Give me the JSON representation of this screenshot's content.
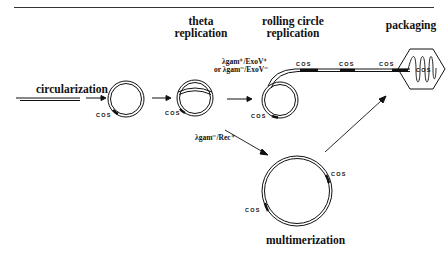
{
  "header": {
    "left": "",
    "center": "",
    "right": ""
  },
  "stages": {
    "circularization": "circularization",
    "theta_line1": "theta",
    "theta_line2": "replication",
    "rolling_line1": "rolling circle",
    "rolling_line2": "replication",
    "packaging": "packaging",
    "multimerization": "multimerization"
  },
  "conditions": {
    "rolling_line1": "λgam⁺/ExoV⁺",
    "rolling_line2": "or λgam⁻/ExoV⁻",
    "multimer": "λgam⁻/Rec⁺"
  },
  "cos_label": "COS"
}
